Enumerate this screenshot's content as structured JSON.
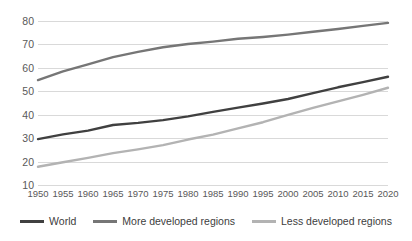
{
  "chart_data": {
    "type": "line",
    "title": "",
    "subtitle": "",
    "xlabel": "",
    "ylabel": "",
    "xlim": [
      1950,
      2020
    ],
    "ylim": [
      10,
      80
    ],
    "grid": "horizontal",
    "legend_position": "bottom",
    "x": [
      1950,
      1955,
      1960,
      1965,
      1970,
      1975,
      1980,
      1985,
      1990,
      1995,
      2000,
      2005,
      2010,
      2015,
      2020
    ],
    "xtick_labels": [
      "1950",
      "1955",
      "1960",
      "1965",
      "1970",
      "1975",
      "1980",
      "1985",
      "1990",
      "1995",
      "2000",
      "2005",
      "2010",
      "2015",
      "2020"
    ],
    "ytick_labels": [
      "10",
      "20",
      "30",
      "40",
      "50",
      "60",
      "70",
      "80"
    ],
    "ytick_values": [
      10,
      20,
      30,
      40,
      50,
      60,
      70,
      80
    ],
    "series": [
      {
        "name": "World",
        "color": "#404040",
        "values": [
          29.6,
          31.6,
          33.2,
          35.6,
          36.5,
          37.7,
          39.3,
          41.2,
          43.0,
          44.8,
          46.7,
          49.2,
          51.7,
          53.9,
          56.2
        ]
      },
      {
        "name": "More developed regions",
        "color": "#767676",
        "values": [
          54.8,
          58.5,
          61.5,
          64.6,
          66.8,
          68.8,
          70.2,
          71.2,
          72.4,
          73.2,
          74.2,
          75.4,
          76.6,
          77.9,
          79.2
        ]
      },
      {
        "name": "Less developed regions",
        "color": "#b3b3b3",
        "values": [
          17.8,
          19.7,
          21.6,
          23.6,
          25.2,
          27.0,
          29.4,
          31.5,
          34.2,
          36.8,
          39.9,
          42.9,
          45.7,
          48.5,
          51.5
        ]
      }
    ]
  },
  "legend": {
    "items": [
      {
        "label": "World",
        "color": "#404040"
      },
      {
        "label": "More developed regions",
        "color": "#767676"
      },
      {
        "label": "Less developed regions",
        "color": "#b3b3b3"
      }
    ]
  },
  "axes": {
    "y_labels": [
      "80",
      "70",
      "60",
      "50",
      "40",
      "30",
      "20",
      "10"
    ],
    "x_labels": [
      "1950",
      "1955",
      "1960",
      "1965",
      "1970",
      "1975",
      "1980",
      "1985",
      "1990",
      "1995",
      "2000",
      "2005",
      "2010",
      "2015",
      "2020"
    ]
  },
  "colors": {
    "gridline": "#d9d9d9",
    "axis_text": "#595959",
    "legend_text": "#404040",
    "background": "#ffffff"
  }
}
